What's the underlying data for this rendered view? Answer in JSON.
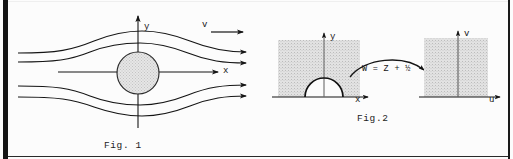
{
  "page": {
    "background": "#fcfcfc",
    "ink": "#151515",
    "shade": "#d9d9d9"
  },
  "figures": [
    {
      "id": "fig1",
      "caption": "Fig. 1",
      "description": "Uniform flow past a circular cylinder with streamlines",
      "axes": {
        "x_label": "x",
        "y_label": "y"
      },
      "flow": {
        "velocity_label": "v",
        "stream_count": 5
      },
      "obstacle": {
        "name": "circular-cylinder",
        "fill": "#d6d6d6"
      }
    },
    {
      "id": "fig2",
      "caption": "Fig.2",
      "description": "Conformal mapping of half plane with semicircular bump onto a half plane",
      "mapping_label": "W = Z + ½",
      "left_region": {
        "x_label": "x",
        "y_label": "y",
        "boundary": "semicircle",
        "fill": "#d9d9d9"
      },
      "right_region": {
        "x_label": "u",
        "y_label": "v",
        "boundary": "straight-line",
        "fill": "#d9d9d9"
      }
    }
  ]
}
